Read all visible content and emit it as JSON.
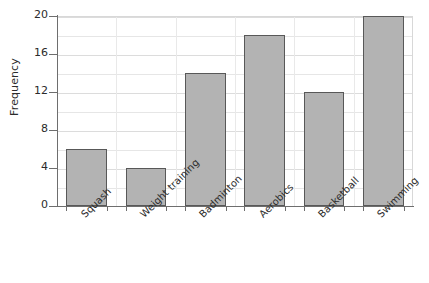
{
  "chart_data": {
    "type": "bar",
    "title": "",
    "xlabel": "",
    "ylabel": "Frequency",
    "categories": [
      "Squash",
      "Weight training",
      "Badminton",
      "Aerobics",
      "Basketball",
      "Swimming"
    ],
    "values": [
      6,
      4,
      14,
      18,
      12,
      20
    ],
    "ylim": [
      0,
      20
    ],
    "ytick_labels": [
      "0",
      "4",
      "8",
      "12",
      "16",
      "20"
    ],
    "ytick_values": [
      0,
      4,
      8,
      12,
      16,
      20
    ],
    "minor_gridline_values": [
      2,
      6,
      10,
      14,
      18
    ],
    "grid": true,
    "legend": "none",
    "bar_fill": "#b3b3b3",
    "bar_border": "#585858",
    "gridline_color": "#e6e6e6",
    "axis_color": "#6e6e6e",
    "text_color": "#2b2b2b",
    "background": "#ffffff",
    "xtick_label_rotation": -45
  }
}
